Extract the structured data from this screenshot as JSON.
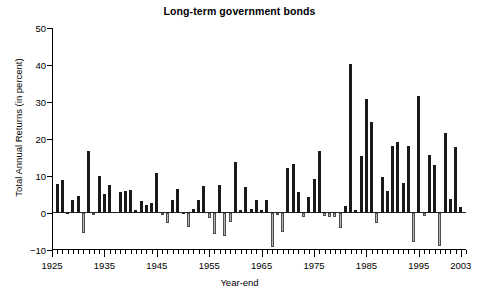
{
  "chart_data": {
    "type": "bar",
    "title": "Long-term government bonds",
    "xlabel": "Year-end",
    "ylabel": "Total Annual Returns (in percent)",
    "ylim": [
      -10,
      50
    ],
    "xlim": [
      1925,
      2004
    ],
    "grid": false,
    "legend": null,
    "ytick_labels": [
      "50",
      "40",
      "30",
      "20",
      "10",
      "0",
      "-10"
    ],
    "ytick_values": [
      50,
      40,
      30,
      20,
      10,
      0,
      -10
    ],
    "xtick_labels": [
      "1925",
      "1935",
      "1945",
      "1955",
      "1965",
      "1975",
      "1985",
      "1995",
      "2003"
    ],
    "xtick_values": [
      1925,
      1935,
      1945,
      1955,
      1965,
      1975,
      1985,
      1995,
      2003
    ],
    "xtick_minor_step": 1,
    "positive_color": "#1a1a1a",
    "negative_color": "#b3b3b3",
    "categories": [
      1926,
      1927,
      1928,
      1929,
      1930,
      1931,
      1932,
      1933,
      1934,
      1935,
      1936,
      1937,
      1938,
      1939,
      1940,
      1941,
      1942,
      1943,
      1944,
      1945,
      1946,
      1947,
      1948,
      1949,
      1950,
      1951,
      1952,
      1953,
      1954,
      1955,
      1956,
      1957,
      1958,
      1959,
      1960,
      1961,
      1962,
      1963,
      1964,
      1965,
      1966,
      1967,
      1968,
      1969,
      1970,
      1971,
      1972,
      1973,
      1974,
      1975,
      1976,
      1977,
      1978,
      1979,
      1980,
      1981,
      1982,
      1983,
      1984,
      1985,
      1986,
      1987,
      1988,
      1989,
      1990,
      1991,
      1992,
      1993,
      1994,
      1995,
      1996,
      1997,
      1998,
      1999,
      2000,
      2001,
      2002,
      2003
    ],
    "values": [
      7.9,
      8.9,
      0.1,
      3.4,
      4.7,
      -5.3,
      16.8,
      -0.1,
      10.1,
      5.2,
      7.5,
      0.2,
      5.6,
      5.9,
      6.1,
      0.9,
      3.2,
      2.1,
      2.8,
      10.7,
      -0.1,
      -2.6,
      3.4,
      6.5,
      0.1,
      -3.9,
      1.2,
      3.6,
      7.2,
      -1.3,
      -5.6,
      7.5,
      -6.1,
      -2.3,
      13.8,
      0.9,
      6.9,
      1.2,
      3.5,
      0.7,
      3.6,
      -9.2,
      -0.3,
      -5.1,
      12.1,
      13.2,
      5.7,
      -1.1,
      4.4,
      9.2,
      16.8,
      -0.7,
      -1.2,
      -1.2,
      -4.0,
      1.9,
      40.4,
      0.7,
      15.4,
      30.9,
      24.5,
      -2.7,
      9.7,
      6.0,
      18.1,
      19.2,
      8.0,
      18.2,
      -7.8,
      31.7,
      -0.9,
      15.8,
      13.0,
      -9.0,
      21.5,
      3.7,
      17.8,
      1.5
    ]
  }
}
